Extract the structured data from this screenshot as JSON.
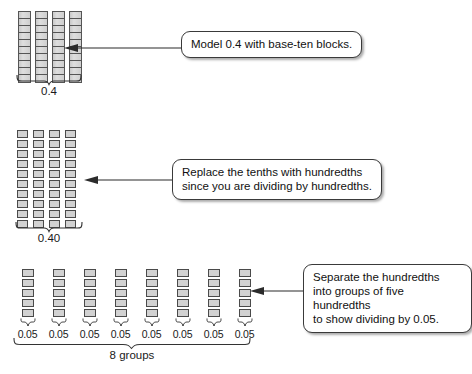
{
  "diagram": {
    "title_concept": "Dividing decimals with base-ten blocks: 0.4 divided by 0.05",
    "rows": [
      {
        "id": "tenths",
        "label": "0.4",
        "block_type": "tenths-rod",
        "rod_count": 4,
        "cells_per_rod": 10,
        "callout": "Model 0.4 with base-ten blocks."
      },
      {
        "id": "hundredths",
        "label": "0.40",
        "block_type": "hundredths-square",
        "column_count": 4,
        "squares_per_column": 10,
        "callout": "Replace the tenths with hundredths\nsince you are dividing by hundredths."
      },
      {
        "id": "groups",
        "label": "8 groups",
        "block_type": "hundredths-square",
        "group_count": 8,
        "squares_per_group": 5,
        "group_labels": [
          "0.05",
          "0.05",
          "0.05",
          "0.05",
          "0.05",
          "0.05",
          "0.05",
          "0.05"
        ],
        "callout": "Separate the hundredths\ninto groups of five hundredths\nto show dividing by 0.05."
      }
    ],
    "colors": {
      "block_fill": "#d2d2d2",
      "block_border": "#4a4a4a",
      "callout_border": "#3a3a3a",
      "background": "#ffffff",
      "arrow": "#2b2b2b"
    }
  }
}
